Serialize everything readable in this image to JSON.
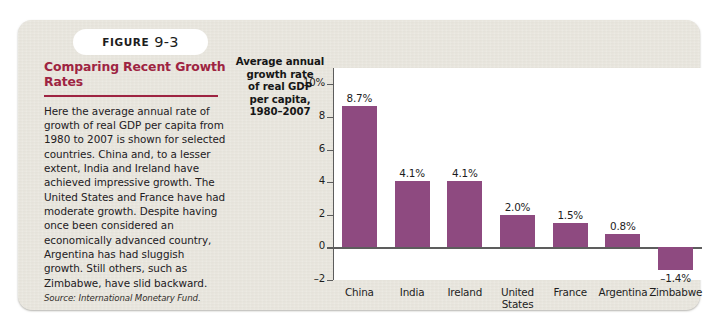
{
  "figure": {
    "tab_word": "FIGURE",
    "tab_number": "9-3",
    "title": "Comparing Recent Growth Rates",
    "body": "Here the average annual rate of growth of real GDP per capita from 1980 to 2007 is shown for selected countries. China and, to a lesser extent, India and Ireland have achieved impressive growth. The United States and France have had moderate growth. Despite having once been considered an economically advanced country, Argentina has had sluggish growth. Still others, such as Zimbabwe, have slid backward.",
    "source": "Source: International Monetary Fund."
  },
  "colors": {
    "bar": "#8e4a80",
    "heading": "#9e2442",
    "card_background": "#e8e5dd",
    "axis": "#5d5d5d",
    "plot_background": "#ffffff"
  },
  "chart_data": {
    "type": "bar",
    "ylabel": "Average annual growth rate of real GDP per capita, 1980–2007",
    "xlabel": "",
    "categories": [
      "China",
      "India",
      "Ireland",
      "United States",
      "France",
      "Argentina",
      "Zimbabwe"
    ],
    "values": [
      8.7,
      4.1,
      4.1,
      2.0,
      1.5,
      0.8,
      -1.4
    ],
    "value_labels": [
      "8.7%",
      "4.1%",
      "4.1%",
      "2.0%",
      "1.5%",
      "0.8%",
      "–1.4%"
    ],
    "ylim": [
      -2,
      11
    ],
    "yticks": [
      10,
      8,
      6,
      4,
      2,
      0,
      -2
    ],
    "ytick_labels": [
      "10%",
      "8",
      "6",
      "4",
      "2",
      "0",
      "–2"
    ],
    "grid": false,
    "legend": "none",
    "series_color": "#8e4a80"
  }
}
